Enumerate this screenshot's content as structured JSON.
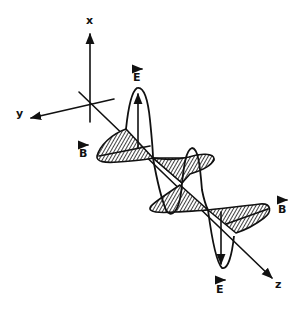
{
  "figure": {
    "axes": {
      "x_label": "x",
      "y_label": "y",
      "z_label": "z"
    },
    "vectors": {
      "e_top": "E",
      "e_bottom": "E",
      "b_left": "B",
      "b_right": "B"
    },
    "colors": {
      "ink": "#111111",
      "background": "#ffffff"
    }
  }
}
